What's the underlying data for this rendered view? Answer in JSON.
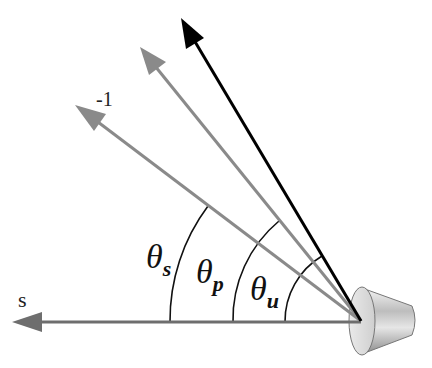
{
  "diagram": {
    "type": "angle-diagram",
    "origin": {
      "x": 361,
      "y": 321
    },
    "colors": {
      "gray_arrow": "#8a8a8a",
      "black_arrow": "#000000",
      "baseline": "#6e6e6e",
      "arc": "#111111"
    },
    "labels": {
      "s": "s",
      "minus_one": "-1",
      "theta_s": {
        "symbol": "θ",
        "subscript": "s"
      },
      "theta_p": {
        "symbol": "θ",
        "subscript": "p"
      },
      "theta_u": {
        "symbol": "θ",
        "subscript": "u"
      }
    },
    "arrows": [
      {
        "name": "s-axis-arrow",
        "tip": {
          "x": 12,
          "y": 322
        },
        "color": "gray"
      },
      {
        "name": "minus-one-arrow",
        "tip": {
          "x": 75,
          "y": 105
        },
        "color": "gray"
      },
      {
        "name": "p-arrow",
        "tip": {
          "x": 140,
          "y": 47
        },
        "color": "gray"
      },
      {
        "name": "u-arrow",
        "tip": {
          "x": 181,
          "y": 18
        },
        "color": "black"
      }
    ],
    "arcs": [
      {
        "name": "theta-s-arc",
        "radius": 191
      },
      {
        "name": "theta-p-arc",
        "radius": 128
      },
      {
        "name": "theta-u-arc",
        "radius": 76
      }
    ],
    "object": "cone-lens-icon"
  }
}
